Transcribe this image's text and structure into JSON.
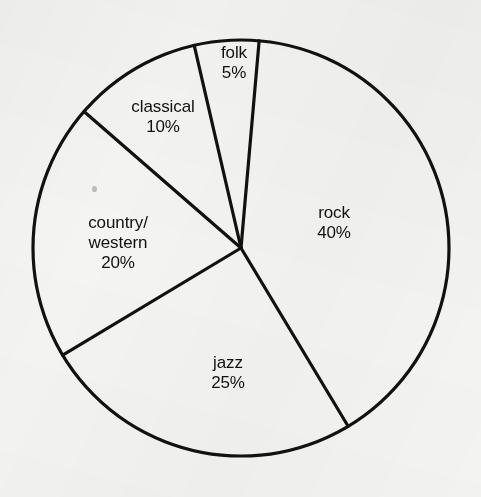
{
  "background_color": "#f4f4f2",
  "stroke_color": "#111111",
  "text_color": "#111111",
  "geometry": {
    "center_x": 241,
    "center_y": 248,
    "radius": 208,
    "stroke_width": 3.2,
    "start_angle_deg": 5
  },
  "chart_data": {
    "type": "pie",
    "title": "",
    "xlabel": "",
    "ylabel": "",
    "legend_position": "none",
    "grid": false,
    "labels_inside_slices": true,
    "total": 100,
    "units": "%",
    "categories": [
      "rock",
      "jazz",
      "country/western",
      "classical",
      "folk"
    ],
    "values": [
      40,
      25,
      20,
      10,
      5
    ],
    "slices": [
      {
        "name": "rock",
        "label": "rock",
        "value": 40,
        "value_text": "40%",
        "label_lines": [
          "rock",
          "40%"
        ],
        "start_angle_deg": 5,
        "end_angle_deg": 149,
        "label_x": 334,
        "label_y": 223
      },
      {
        "name": "jazz",
        "label": "jazz",
        "value": 25,
        "value_text": "25%",
        "label_lines": [
          "jazz",
          "25%"
        ],
        "start_angle_deg": 149,
        "end_angle_deg": 239,
        "label_x": 228,
        "label_y": 373
      },
      {
        "name": "country/western",
        "label": "country/western",
        "value": 20,
        "value_text": "20%",
        "label_lines": [
          "country/",
          "western",
          "20%"
        ],
        "start_angle_deg": 239,
        "end_angle_deg": 311,
        "label_x": 118,
        "label_y": 243
      },
      {
        "name": "classical",
        "label": "classical",
        "value": 10,
        "value_text": "10%",
        "label_lines": [
          "classical",
          "10%"
        ],
        "start_angle_deg": 311,
        "end_angle_deg": 347,
        "label_x": 163,
        "label_y": 117
      },
      {
        "name": "folk",
        "label": "folk",
        "value": 5,
        "value_text": "5%",
        "label_lines": [
          "folk",
          "5%"
        ],
        "start_angle_deg": 347,
        "end_angle_deg": 365,
        "label_x": 234,
        "label_y": 63
      }
    ]
  },
  "artifacts": {
    "speck_x": 92,
    "speck_y": 186
  }
}
